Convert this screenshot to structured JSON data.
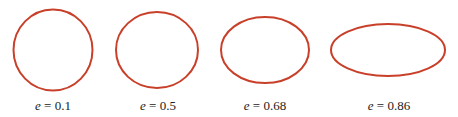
{
  "figure": {
    "stroke_color": "#c8402a",
    "background": "#ffffff",
    "ellipses": [
      {
        "e": "0.1",
        "variable": "e",
        "equals": " = ",
        "value": "0.1",
        "cx": 53,
        "cy": 50,
        "rx": 39.5,
        "ry": 40.5
      },
      {
        "e": "0.5",
        "variable": "e",
        "equals": " = ",
        "value": "0.5",
        "cx": 157,
        "cy": 50,
        "rx": 41,
        "ry": 38
      },
      {
        "e": "0.68",
        "variable": "e",
        "equals": " = ",
        "value": "0.68",
        "cx": 265,
        "cy": 50,
        "rx": 44,
        "ry": 33
      },
      {
        "e": "0.86",
        "variable": "e",
        "equals": " = ",
        "value": "0.86",
        "cx": 388,
        "cy": 50,
        "rx": 57,
        "ry": 26
      }
    ]
  }
}
